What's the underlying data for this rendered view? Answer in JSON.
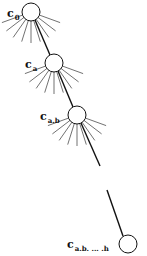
{
  "diagram": {
    "title": "",
    "nodes": [
      {
        "id": "c0",
        "label_main": "c",
        "label_sub": "0",
        "cx": 31,
        "cy": 12,
        "r": 9,
        "label_x": 7,
        "label_y": 4,
        "fan": true
      },
      {
        "id": "ca",
        "label_main": "c",
        "label_sub": "a",
        "cx": 54,
        "cy": 63,
        "r": 9,
        "label_x": 25,
        "label_y": 55,
        "fan": true
      },
      {
        "id": "cab",
        "label_main": "c",
        "label_sub": "a.b",
        "cx": 77,
        "cy": 115,
        "r": 9,
        "label_x": 40,
        "label_y": 107,
        "fan": true
      },
      {
        "id": "cabh",
        "label_main": "c",
        "label_sub": "a.b. ... .h",
        "cx": 128,
        "cy": 244,
        "r": 9,
        "label_x": 67,
        "label_y": 235,
        "fan": false
      }
    ],
    "edges": [
      {
        "from": "c0",
        "to": "ca",
        "x1": 35,
        "y1": 20,
        "x2": 50,
        "y2": 55
      },
      {
        "from": "ca",
        "to": "cab",
        "x1": 58,
        "y1": 71,
        "x2": 73,
        "y2": 107
      },
      {
        "from": "cab",
        "to": "gap",
        "x1": 81,
        "y1": 123,
        "x2": 100,
        "y2": 166
      },
      {
        "from": "gap",
        "to": "cabh",
        "x1": 107,
        "y1": 190,
        "x2": 123,
        "y2": 236
      }
    ],
    "colors": {
      "stroke": "#111111",
      "fan_stroke": "#333333",
      "background": "#ffffff"
    }
  }
}
